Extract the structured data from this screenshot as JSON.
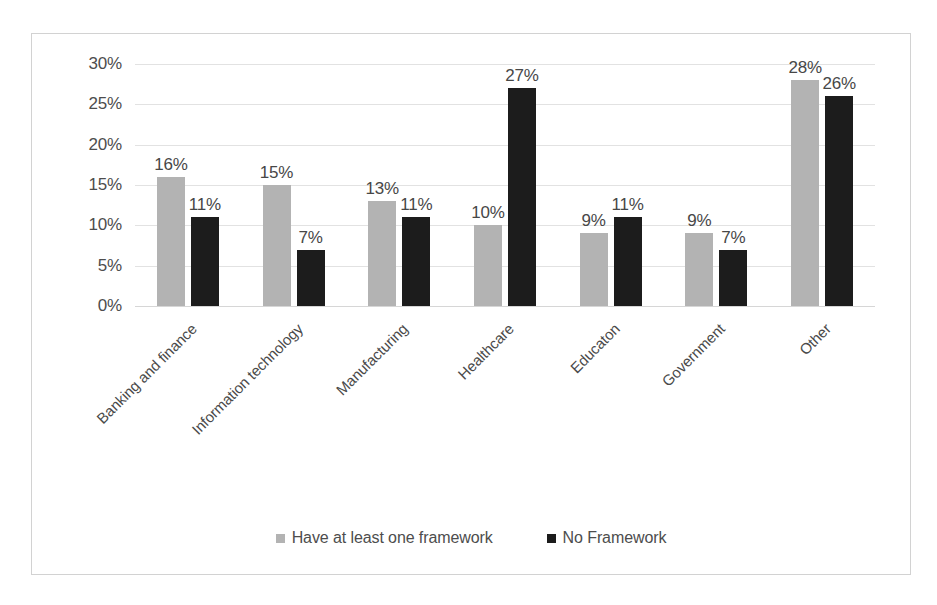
{
  "chart_data": {
    "type": "bar",
    "title": "",
    "subtitle": "",
    "xlabel": "",
    "ylabel": "",
    "ylim": [
      0,
      30
    ],
    "y_ticks": [
      "0%",
      "5%",
      "10%",
      "15%",
      "20%",
      "25%",
      "30%"
    ],
    "y_tick_values": [
      0,
      5,
      10,
      15,
      20,
      25,
      30
    ],
    "grid": true,
    "legend_position": "bottom",
    "categories": [
      "Banking and finance",
      "Information technology",
      "Manufacturing",
      "Healthcare",
      "Educaton",
      "Government",
      "Other"
    ],
    "series": [
      {
        "name": "Have at least one framework",
        "color": "#b3b3b3",
        "values": [
          16,
          15,
          13,
          10,
          9,
          9,
          28
        ],
        "labels": [
          "16%",
          "15%",
          "13%",
          "10%",
          "9%",
          "9%",
          "28%"
        ]
      },
      {
        "name": "No Framework",
        "color": "#1c1c1c",
        "values": [
          11,
          7,
          11,
          27,
          11,
          7,
          26
        ],
        "labels": [
          "11%",
          "7%",
          "11%",
          "27%",
          "11%",
          "7%",
          "26%"
        ]
      }
    ]
  },
  "legend": {
    "items": [
      {
        "label": "Have at least one framework",
        "marker": "square-marker-light"
      },
      {
        "label": "No Framework",
        "marker": "square-marker-dark"
      }
    ]
  },
  "colors": {
    "series_light": "#b3b3b3",
    "series_dark": "#1c1c1c",
    "gridline": "#e2e2e2",
    "frame_border": "#d2d2d2",
    "text": "#4d4d4d",
    "background": "#ffffff"
  }
}
